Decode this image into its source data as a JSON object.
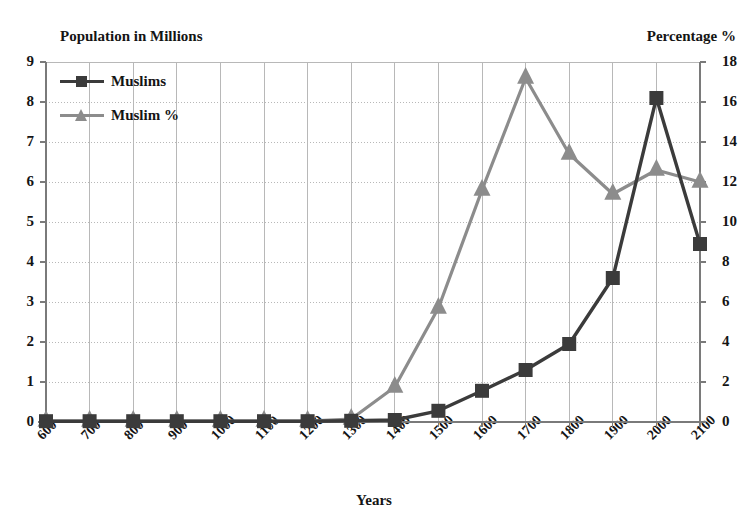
{
  "chart_data": {
    "type": "line",
    "title": "",
    "xlabel": "Years",
    "ylabel": "Population in Millions",
    "y2label": "Percentage %",
    "categories": [
      "600",
      "700",
      "800",
      "900",
      "1000",
      "1100",
      "1200",
      "1300",
      "1400",
      "1500",
      "1600",
      "1700",
      "1800",
      "1900",
      "2000",
      "2100"
    ],
    "ylim": [
      0,
      9
    ],
    "y2lim": [
      0,
      18
    ],
    "yticks": [
      "0",
      "1",
      "2",
      "3",
      "4",
      "5",
      "6",
      "7",
      "8",
      "9"
    ],
    "y2ticks": [
      "0",
      "2",
      "4",
      "6",
      "8",
      "10",
      "12",
      "14",
      "16",
      "18"
    ],
    "grid": true,
    "legend_position": "top-left",
    "series": [
      {
        "name": "Muslims",
        "axis": "left",
        "units": "millions",
        "color": "#3b3b3b",
        "marker": "square",
        "values": [
          0.02,
          0.02,
          0.02,
          0.02,
          0.02,
          0.02,
          0.02,
          0.03,
          0.05,
          0.28,
          0.78,
          1.3,
          1.95,
          3.6,
          8.1,
          4.45
        ]
      },
      {
        "name": "Muslim %",
        "axis": "right",
        "units": "percent",
        "color": "#8c8c8c",
        "marker": "triangle",
        "values": [
          0.05,
          0.05,
          0.05,
          0.05,
          0.05,
          0.05,
          0.05,
          0.15,
          1.75,
          5.7,
          11.6,
          17.2,
          13.4,
          11.4,
          12.6,
          12.0
        ]
      }
    ]
  },
  "colors": {
    "series_dark": "#3b3b3b",
    "series_gray": "#8c8c8c",
    "axis": "#7a7a7a",
    "grid": "#b8b8b8",
    "text": "#141414",
    "background": "#ffffff"
  }
}
